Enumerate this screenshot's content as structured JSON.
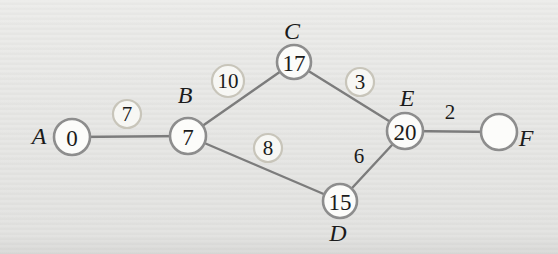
{
  "figure": {
    "kind": "weighted-graph-diagram",
    "colors": {
      "background": "#eaeae8",
      "edge_stroke": "#7c7c7c",
      "node_stroke": "#8d8d8d",
      "node_fill": "#fcfcfa",
      "badge_stroke": "#c8c5ba",
      "badge_fill": "#f7f7f4",
      "text": "#1b1b1b"
    },
    "stroke_widths": {
      "edge": 2.4,
      "node": 2.6,
      "badge": 2.2
    },
    "nodes": [
      {
        "id": "A",
        "letter": "A",
        "value": "0",
        "x": 72,
        "y": 137,
        "r": 18,
        "label_x": 39,
        "label_y": 136
      },
      {
        "id": "B",
        "letter": "B",
        "value": "7",
        "x": 188,
        "y": 136,
        "r": 18,
        "label_x": 185,
        "label_y": 95
      },
      {
        "id": "C",
        "letter": "C",
        "value": "17",
        "x": 294,
        "y": 62,
        "r": 17,
        "label_x": 292,
        "label_y": 31
      },
      {
        "id": "D",
        "letter": "D",
        "value": "15",
        "x": 340,
        "y": 201,
        "r": 17,
        "label_x": 338,
        "label_y": 233
      },
      {
        "id": "E",
        "letter": "E",
        "value": "20",
        "x": 405,
        "y": 131,
        "r": 18,
        "label_x": 407,
        "label_y": 98
      },
      {
        "id": "F",
        "letter": "F",
        "value": "",
        "x": 499,
        "y": 132,
        "r": 18,
        "label_x": 526,
        "label_y": 138
      }
    ],
    "edges": [
      {
        "from": "A",
        "to": "B",
        "weight": "7",
        "circled": true,
        "wx": 127,
        "wy": 114,
        "wr": 14
      },
      {
        "from": "B",
        "to": "C",
        "weight": "10",
        "circled": true,
        "wx": 228,
        "wy": 81,
        "wr": 16
      },
      {
        "from": "B",
        "to": "D",
        "weight": "8",
        "circled": true,
        "wx": 268,
        "wy": 148,
        "wr": 14
      },
      {
        "from": "C",
        "to": "E",
        "weight": "3",
        "circled": true,
        "wx": 360,
        "wy": 82,
        "wr": 14
      },
      {
        "from": "D",
        "to": "E",
        "weight": "6",
        "circled": false,
        "wx": 359,
        "wy": 156,
        "wr": 0
      },
      {
        "from": "E",
        "to": "F",
        "weight": "2",
        "circled": false,
        "wx": 450,
        "wy": 112,
        "wr": 0
      }
    ]
  }
}
